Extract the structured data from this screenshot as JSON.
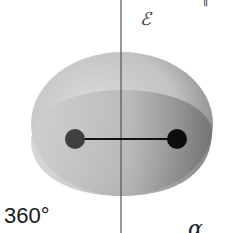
{
  "diagram": {
    "angle_label": "360°",
    "field_label": "ℰ",
    "alpha_label": "α",
    "top_right_mark": "∥",
    "colors": {
      "ellipsoid_light": "#c9c9c9",
      "ellipsoid_dark": "#8a8a8a",
      "atom_left": "#3f3f3f",
      "atom_right": "#0d0d0d",
      "bond": "#111111",
      "axis": "#555555"
    }
  }
}
